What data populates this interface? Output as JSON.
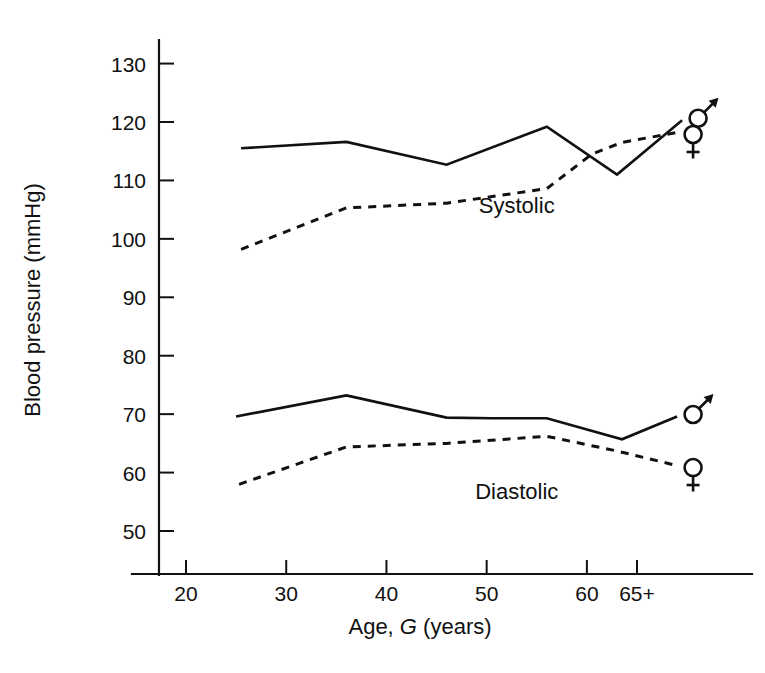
{
  "chart_data": {
    "type": "line",
    "title": "",
    "xlabel": "Age, G (years)",
    "xlabel_parts": {
      "pre": "Age, ",
      "italic": "G",
      "post": " (years)"
    },
    "ylabel": "Blood pressure (mmHg)",
    "x_tick_labels": [
      "20",
      "30",
      "40",
      "50",
      "60",
      "65+"
    ],
    "x_tick_values": [
      20,
      30,
      40,
      50,
      60,
      65
    ],
    "y_tick_labels": [
      "50",
      "60",
      "70",
      "80",
      "90",
      "100",
      "110",
      "120",
      "130"
    ],
    "y_tick_values": [
      50,
      60,
      70,
      80,
      90,
      100,
      110,
      120,
      130
    ],
    "ylim": [
      44,
      134
    ],
    "xlim": [
      14,
      72
    ],
    "grid": false,
    "legend_position": "right-end-symbols",
    "annotations": [
      {
        "text": "Systolic",
        "x": 53,
        "y": 104.5
      },
      {
        "text": "Diastolic",
        "x": 53,
        "y": 55.5
      }
    ],
    "series": [
      {
        "name": "Systolic male",
        "group": "Systolic",
        "sex": "male",
        "symbol": "mars",
        "style": "solid",
        "x": [
          25.5,
          36,
          46,
          56,
          63,
          69.5
        ],
        "values": [
          115.5,
          116.6,
          112.7,
          119.2,
          111.0,
          120.3
        ]
      },
      {
        "name": "Systolic female",
        "group": "Systolic",
        "sex": "female",
        "symbol": "venus",
        "style": "dashed",
        "x": [
          25.5,
          36,
          46,
          56,
          60.5,
          63.5,
          69
        ],
        "values": [
          98.2,
          105.3,
          106.1,
          108.6,
          114.5,
          116.5,
          118.2
        ]
      },
      {
        "name": "Diastolic male",
        "group": "Diastolic",
        "sex": "male",
        "symbol": "mars",
        "style": "solid",
        "x": [
          25.0,
          36,
          46,
          50.5,
          56,
          63.5,
          69
        ],
        "values": [
          69.6,
          73.2,
          69.4,
          69.3,
          69.3,
          65.7,
          69.6
        ]
      },
      {
        "name": "Diastolic female",
        "group": "Diastolic",
        "sex": "female",
        "symbol": "venus",
        "style": "dashed",
        "x": [
          25.3,
          36,
          46,
          56,
          63,
          69
        ],
        "values": [
          58.0,
          64.4,
          65.0,
          66.2,
          63.7,
          61.2
        ]
      }
    ]
  },
  "symbols": {
    "mars_name": "male-symbol",
    "venus_name": "female-symbol",
    "mars_glyph": "♂",
    "venus_glyph": "♀"
  },
  "colors": {
    "ink": "#111111",
    "background": "#ffffff"
  }
}
